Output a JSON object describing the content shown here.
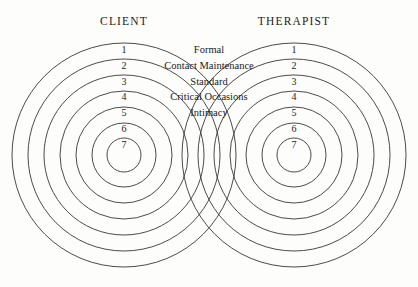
{
  "diagram": {
    "title_left": "CLIENT",
    "title_right": "THERAPIST",
    "ring_numbers": [
      "1",
      "2",
      "3",
      "4",
      "5",
      "6",
      "7"
    ],
    "center_labels": [
      "Formal",
      "Contact Maintenance",
      "Standard",
      "Critical Occasions",
      "Intimacy"
    ],
    "colors": {
      "background": "#fdfdfc",
      "stroke": "#3a3733",
      "text": "#1c1a18"
    },
    "geometry": {
      "left_center_x": 124,
      "right_center_x": 294,
      "center_y": 155,
      "ring_count": 7,
      "radii": [
        112,
        96,
        80,
        64,
        48,
        32,
        17
      ]
    }
  }
}
